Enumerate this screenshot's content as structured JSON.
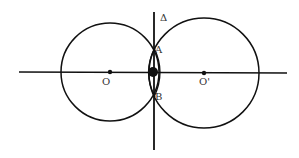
{
  "diagram": {
    "labels": {
      "delta": "Δ",
      "A": "A",
      "B": "B",
      "O": "O",
      "O_prime": "O'"
    },
    "colors": {
      "stroke": "#111111",
      "background": "#ffffff"
    }
  }
}
